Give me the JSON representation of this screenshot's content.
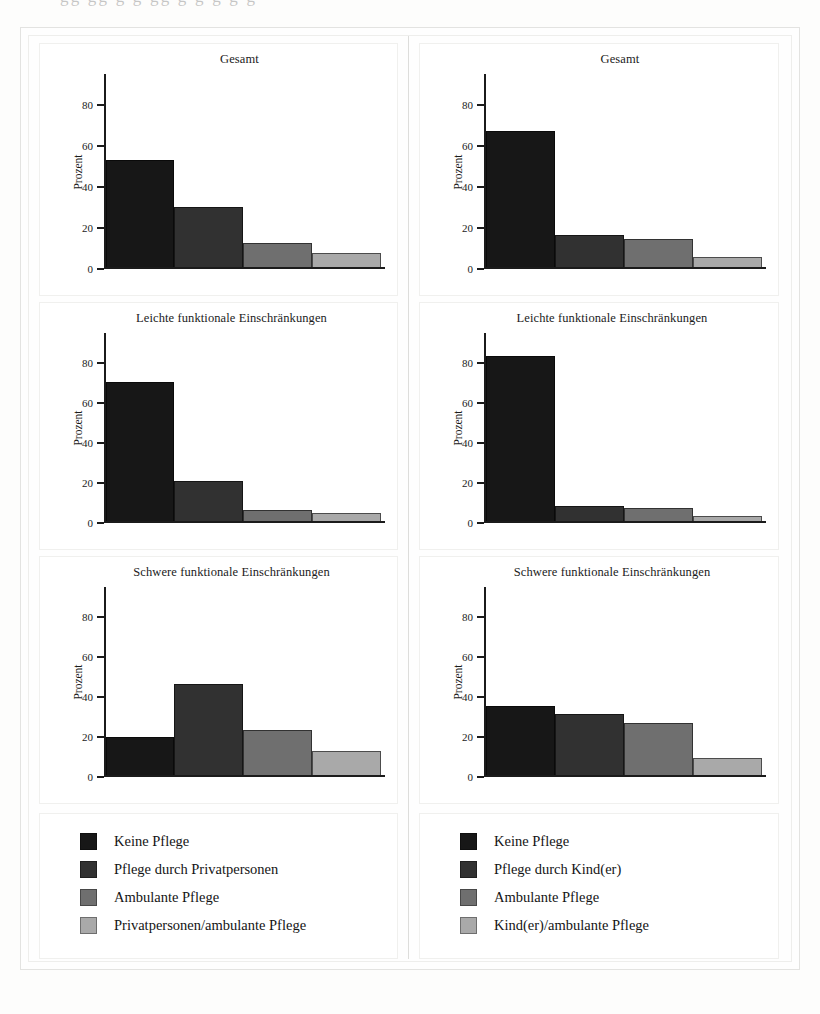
{
  "figure": {
    "y_axis_title": "Prozent",
    "y_ticks": [
      0,
      20,
      40,
      60,
      80
    ],
    "y_min": 0,
    "y_max": 95
  },
  "chart_data": [
    {
      "type": "bar",
      "panel": "left-gesamt",
      "title": "Gesamt",
      "xlabel": "",
      "ylabel": "Prozent",
      "ylim": [
        0,
        95
      ],
      "grid": false,
      "categories": [
        "Keine Pflege",
        "Pflege durch Privatpersonen",
        "Ambulante Pflege",
        "Privatpersonen/ambulante Pflege"
      ],
      "values": [
        53,
        29.5,
        12,
        7
      ]
    },
    {
      "type": "bar",
      "panel": "left-leichte",
      "title": "Leichte funktionale Einschränkungen",
      "xlabel": "",
      "ylabel": "Prozent",
      "ylim": [
        0,
        95
      ],
      "grid": false,
      "categories": [
        "Keine Pflege",
        "Pflege durch Privatpersonen",
        "Ambulante Pflege",
        "Privatpersonen/ambulante Pflege"
      ],
      "values": [
        70.5,
        20.5,
        6,
        4
      ]
    },
    {
      "type": "bar",
      "panel": "left-schwere",
      "title": "Schwere funktionale Einschränkungen",
      "xlabel": "",
      "ylabel": "Prozent",
      "ylim": [
        0,
        95
      ],
      "grid": false,
      "categories": [
        "Keine Pflege",
        "Pflege durch Privatpersonen",
        "Ambulante Pflege",
        "Privatpersonen/ambulante Pflege"
      ],
      "values": [
        19.5,
        46,
        23,
        12.5
      ]
    },
    {
      "type": "bar",
      "panel": "right-gesamt",
      "title": "Gesamt",
      "xlabel": "",
      "ylabel": "Prozent",
      "ylim": [
        0,
        95
      ],
      "grid": false,
      "categories": [
        "Keine Pflege",
        "Pflege durch Kind(er)",
        "Ambulante Pflege",
        "Kind(er)/ambulante Pflege"
      ],
      "values": [
        67,
        16,
        14,
        5
      ]
    },
    {
      "type": "bar",
      "panel": "right-leichte",
      "title": "Leichte funktionale Einschränkungen",
      "xlabel": "",
      "ylabel": "Prozent",
      "ylim": [
        0,
        95
      ],
      "grid": false,
      "categories": [
        "Keine Pflege",
        "Pflege durch Kind(er)",
        "Ambulante Pflege",
        "Kind(er)/ambulante Pflege"
      ],
      "values": [
        83.5,
        8,
        7,
        2.5
      ]
    },
    {
      "type": "bar",
      "panel": "right-schwere",
      "title": "Schwere funktionale Einschränkungen",
      "xlabel": "",
      "ylabel": "Prozent",
      "ylim": [
        0,
        95
      ],
      "grid": false,
      "categories": [
        "Keine Pflege",
        "Pflege durch Kind(er)",
        "Ambulante Pflege",
        "Kind(er)/ambulante Pflege"
      ],
      "values": [
        35,
        31,
        26.5,
        9
      ]
    }
  ],
  "left_column": {
    "panels": [
      {
        "title": "Gesamt",
        "values": [
          53,
          29.5,
          12,
          7
        ]
      },
      {
        "title": "Leichte funktionale Einschränkungen",
        "values": [
          70.5,
          20.5,
          6,
          4
        ]
      },
      {
        "title": "Schwere funktionale Einschränkungen",
        "values": [
          19.5,
          46,
          23,
          12.5
        ]
      }
    ],
    "legend": [
      {
        "label": "Keine Pflege",
        "color": "#171717"
      },
      {
        "label": "Pflege durch Privatpersonen",
        "color": "#313131"
      },
      {
        "label": "Ambulante Pflege",
        "color": "#6f6f6f"
      },
      {
        "label": "Privatpersonen/ambulante Pflege",
        "color": "#a9a9a9"
      }
    ]
  },
  "right_column": {
    "panels": [
      {
        "title": "Gesamt",
        "values": [
          67,
          16,
          14,
          5
        ]
      },
      {
        "title": "Leichte funktionale Einschränkungen",
        "values": [
          83.5,
          8,
          7,
          2.5
        ]
      },
      {
        "title": "Schwere funktionale Einschränkungen",
        "values": [
          35,
          31,
          26.5,
          9
        ]
      }
    ],
    "legend": [
      {
        "label": "Keine Pflege",
        "color": "#171717"
      },
      {
        "label": "Pflege durch Kind(er)",
        "color": "#313131"
      },
      {
        "label": "Ambulante Pflege",
        "color": "#6f6f6f"
      },
      {
        "label": "Kind(er)/ambulante Pflege",
        "color": "#a9a9a9"
      }
    ]
  }
}
